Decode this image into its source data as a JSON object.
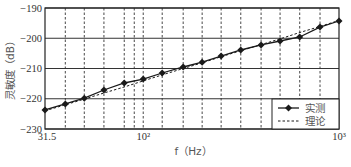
{
  "chart_data": {
    "type": "line",
    "title": "",
    "xlabel": "f（Hz）",
    "ylabel": "灵敏度（dB）",
    "xscale": "log",
    "xlim": [
      31.5,
      1000
    ],
    "ylim": [
      -230,
      -190
    ],
    "x_tick_labels": [
      "31.5",
      "10²",
      "10³"
    ],
    "x_tick_values": [
      31.5,
      100,
      1000
    ],
    "y_ticks": [
      -190,
      -200,
      -210,
      -220,
      -230
    ],
    "y_tick_labels": [
      "−190",
      "−200",
      "−210",
      "−220",
      "−230"
    ],
    "grid": {
      "horizontal": "solid",
      "vertical": "dashed"
    },
    "vertical_grid_freqs": [
      40,
      50,
      63,
      80,
      90,
      100,
      125,
      160,
      200,
      250,
      315,
      400,
      500,
      630,
      800
    ],
    "legend_position": "lower right",
    "x": [
      31.5,
      40,
      50,
      63,
      80,
      100,
      125,
      160,
      200,
      250,
      315,
      400,
      500,
      630,
      800,
      1000
    ],
    "series": [
      {
        "name": "实测",
        "style": "solid-diamond",
        "values": [
          -223.7,
          -221.7,
          -219.8,
          -217.1,
          -214.8,
          -213.5,
          -211.5,
          -209.5,
          -207.9,
          -205.9,
          -203.9,
          -202.2,
          -200.9,
          -199.6,
          -196.3,
          -194.3
        ]
      },
      {
        "name": "理论",
        "style": "dashed",
        "values": [
          -224.0,
          -222.0,
          -220.1,
          -218.1,
          -216.1,
          -214.1,
          -212.1,
          -210.0,
          -208.1,
          -206.1,
          -204.1,
          -202.1,
          -200.2,
          -198.1,
          -196.1,
          -194.1
        ]
      }
    ]
  },
  "colors": {
    "line": "#1a1a1a",
    "grid": "#333333",
    "text": "#444444"
  }
}
